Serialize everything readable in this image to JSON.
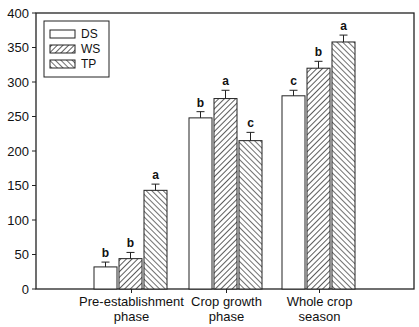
{
  "chart_data": {
    "type": "bar",
    "title": "",
    "xlabel": "",
    "ylabel": "",
    "ylim": [
      0,
      400
    ],
    "yticks": [
      0,
      50,
      100,
      150,
      200,
      250,
      300,
      350,
      400
    ],
    "grid": false,
    "legend_position": "upper left",
    "categories": [
      "Pre-establishment phase",
      "Crop growth phase",
      "Whole crop season"
    ],
    "category_lines": [
      [
        "Pre-establishment",
        "phase"
      ],
      [
        "Crop growth",
        "phase"
      ],
      [
        "Whole crop",
        "season"
      ]
    ],
    "series": [
      {
        "name": "DS",
        "pattern": "none",
        "values": [
          32,
          248,
          280
        ],
        "errors": [
          7,
          9,
          8
        ],
        "letters": [
          "b",
          "b",
          "c"
        ]
      },
      {
        "name": "WS",
        "pattern": "diag-forward",
        "values": [
          44,
          276,
          320
        ],
        "errors": [
          9,
          12,
          10
        ],
        "letters": [
          "b",
          "a",
          "b"
        ]
      },
      {
        "name": "TP",
        "pattern": "diag-backward",
        "values": [
          143,
          215,
          358
        ],
        "errors": [
          9,
          12,
          10
        ],
        "letters": [
          "a",
          "c",
          "a"
        ]
      }
    ]
  }
}
